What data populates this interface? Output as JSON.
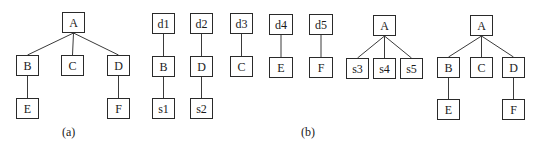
{
  "figure": {
    "panels": [
      {
        "id": "a",
        "caption": "(a)",
        "trees": [
          {
            "root": "A",
            "nodes": [
              {
                "id": "a_A",
                "label": "A",
                "x": 62,
                "y": 12,
                "w": 23,
                "h": 21
              },
              {
                "id": "a_B",
                "label": "B",
                "x": 16,
                "y": 55,
                "w": 23,
                "h": 21
              },
              {
                "id": "a_C",
                "label": "C",
                "x": 61,
                "y": 55,
                "w": 23,
                "h": 21
              },
              {
                "id": "a_D",
                "label": "D",
                "x": 107,
                "y": 55,
                "w": 23,
                "h": 21
              },
              {
                "id": "a_E",
                "label": "E",
                "x": 16,
                "y": 98,
                "w": 23,
                "h": 21
              },
              {
                "id": "a_F",
                "label": "F",
                "x": 107,
                "y": 98,
                "w": 23,
                "h": 21
              }
            ],
            "edges": [
              [
                "a_A",
                "a_B"
              ],
              [
                "a_A",
                "a_C"
              ],
              [
                "a_A",
                "a_D"
              ],
              [
                "a_B",
                "a_E"
              ],
              [
                "a_D",
                "a_F"
              ]
            ]
          }
        ]
      },
      {
        "id": "b",
        "caption": "(b)",
        "trees": [
          {
            "root": "d1",
            "nodes": [
              {
                "id": "b_d1",
                "label": "d1",
                "x": 152,
                "y": 13,
                "w": 23,
                "h": 21
              },
              {
                "id": "b_B",
                "label": "B",
                "x": 152,
                "y": 56,
                "w": 23,
                "h": 21
              },
              {
                "id": "b_s1",
                "label": "s1",
                "x": 152,
                "y": 98,
                "w": 23,
                "h": 21
              }
            ],
            "edges": [
              [
                "b_d1",
                "b_B"
              ],
              [
                "b_B",
                "b_s1"
              ]
            ]
          },
          {
            "root": "d2",
            "nodes": [
              {
                "id": "b_d2",
                "label": "d2",
                "x": 190,
                "y": 13,
                "w": 23,
                "h": 21
              },
              {
                "id": "b_D",
                "label": "D",
                "x": 190,
                "y": 56,
                "w": 23,
                "h": 21
              },
              {
                "id": "b_s2",
                "label": "s2",
                "x": 190,
                "y": 98,
                "w": 23,
                "h": 21
              }
            ],
            "edges": [
              [
                "b_d2",
                "b_D"
              ],
              [
                "b_D",
                "b_s2"
              ]
            ]
          },
          {
            "root": "d3",
            "nodes": [
              {
                "id": "b_d3",
                "label": "d3",
                "x": 230,
                "y": 13,
                "w": 23,
                "h": 21
              },
              {
                "id": "b_C",
                "label": "C",
                "x": 230,
                "y": 56,
                "w": 23,
                "h": 21
              }
            ],
            "edges": [
              [
                "b_d3",
                "b_C"
              ]
            ]
          },
          {
            "root": "d4",
            "nodes": [
              {
                "id": "b_d4",
                "label": "d4",
                "x": 269,
                "y": 14,
                "w": 24,
                "h": 21
              },
              {
                "id": "b_E",
                "label": "E",
                "x": 269,
                "y": 57,
                "w": 24,
                "h": 21
              }
            ],
            "edges": [
              [
                "b_d4",
                "b_E"
              ]
            ]
          },
          {
            "root": "d5",
            "nodes": [
              {
                "id": "b_d5",
                "label": "d5",
                "x": 309,
                "y": 14,
                "w": 24,
                "h": 21
              },
              {
                "id": "b_F",
                "label": "F",
                "x": 309,
                "y": 57,
                "w": 24,
                "h": 21
              }
            ],
            "edges": [
              [
                "b_d5",
                "b_F"
              ]
            ]
          },
          {
            "root": "A",
            "nodes": [
              {
                "id": "b_A",
                "label": "A",
                "x": 373,
                "y": 15,
                "w": 23,
                "h": 21
              },
              {
                "id": "b_s3",
                "label": "s3",
                "x": 346,
                "y": 58,
                "w": 23,
                "h": 21
              },
              {
                "id": "b_s4",
                "label": "s4",
                "x": 373,
                "y": 58,
                "w": 23,
                "h": 21
              },
              {
                "id": "b_s5",
                "label": "s5",
                "x": 400,
                "y": 58,
                "w": 23,
                "h": 21
              }
            ],
            "edges": [
              [
                "b_A",
                "b_s3"
              ],
              [
                "b_A",
                "b_s4"
              ],
              [
                "b_A",
                "b_s5"
              ]
            ]
          },
          {
            "root": "A",
            "nodes": [
              {
                "id": "c_A",
                "label": "A",
                "x": 470,
                "y": 15,
                "w": 23,
                "h": 21
              },
              {
                "id": "c_B",
                "label": "B",
                "x": 437,
                "y": 57,
                "w": 23,
                "h": 21
              },
              {
                "id": "c_C",
                "label": "C",
                "x": 470,
                "y": 57,
                "w": 23,
                "h": 21
              },
              {
                "id": "c_D",
                "label": "D",
                "x": 502,
                "y": 57,
                "w": 23,
                "h": 21
              },
              {
                "id": "c_E",
                "label": "E",
                "x": 437,
                "y": 99,
                "w": 23,
                "h": 21
              },
              {
                "id": "c_F",
                "label": "F",
                "x": 502,
                "y": 99,
                "w": 23,
                "h": 21
              }
            ],
            "edges": [
              [
                "c_A",
                "c_B"
              ],
              [
                "c_A",
                "c_C"
              ],
              [
                "c_A",
                "c_D"
              ],
              [
                "c_B",
                "c_E"
              ],
              [
                "c_D",
                "c_F"
              ]
            ]
          }
        ]
      }
    ],
    "captions": {
      "a": {
        "text": "(a)",
        "x": 62,
        "y": 126
      },
      "b": {
        "text": "(b)",
        "x": 301,
        "y": 126
      }
    }
  }
}
